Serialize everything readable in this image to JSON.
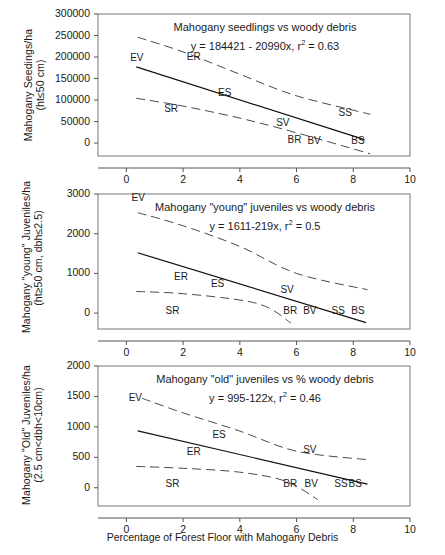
{
  "figure": {
    "xaxis_title": "Percentage of Forest Floor with Mahogany Debris",
    "x_ticks": [
      "0",
      "2",
      "4",
      "6",
      "8",
      "10"
    ]
  },
  "chart_data": [
    {
      "type": "scatter",
      "panel": 1,
      "title": "Mahogany seedlings vs woody debris",
      "equation": "y = 184421 - 20990x, r",
      "equation_sup": "2",
      "equation_tail": " = 0.63",
      "slope": -20990,
      "intercept": 184421,
      "r2": 0.63,
      "xlabel": "Percentage of Forest Floor with Mahogany Debris",
      "ylabel_line1": "Mahogany Seedings/ha",
      "ylabel_line2": "(ht≤50 cm)",
      "xlim": [
        -1,
        10
      ],
      "ylim": [
        -30000,
        300000
      ],
      "x_ticks": [
        0,
        2,
        4,
        6,
        8,
        10
      ],
      "y_ticks": [
        0,
        50000,
        100000,
        150000,
        200000,
        250000,
        300000
      ],
      "y_tick_labels": [
        "0",
        "50000",
        "100000",
        "150000",
        "200000",
        "250000",
        "300000"
      ],
      "grid": false,
      "legend": "none",
      "fit_line": {
        "x": [
          0.35,
          8.4
        ],
        "y": [
          177000,
          8000
        ]
      },
      "upper_band": {
        "x": [
          0.4,
          2.0,
          4.0,
          6.0,
          8.6
        ],
        "y": [
          246000,
          212000,
          160000,
          110000,
          67000
        ]
      },
      "lower_band": {
        "x": [
          0.35,
          2.0,
          4.0,
          6.0,
          8.6
        ],
        "y": [
          104000,
          86000,
          58000,
          24000,
          -25000
        ]
      },
      "point_labels": [
        {
          "label": "EV",
          "x": 0.45,
          "y": 196000
        },
        {
          "label": "ER",
          "x": 2.45,
          "y": 197000
        },
        {
          "label": "ES",
          "x": 3.55,
          "y": 115000
        },
        {
          "label": "SR",
          "x": 1.65,
          "y": 77000
        },
        {
          "label": "SV",
          "x": 5.6,
          "y": 45000
        },
        {
          "label": "SS",
          "x": 7.8,
          "y": 67000
        },
        {
          "label": "BR",
          "x": 6.0,
          "y": 6000
        },
        {
          "label": "BV",
          "x": 6.7,
          "y": 3000
        },
        {
          "label": "BS",
          "x": 8.25,
          "y": 3000
        }
      ]
    },
    {
      "type": "scatter",
      "panel": 2,
      "title": "Mahogany \"young\" juveniles vs woody debris",
      "equation": "y = 1611-219x, r",
      "equation_sup": "2",
      "equation_tail": " = 0.5",
      "slope": -219,
      "intercept": 1611,
      "r2": 0.5,
      "ylabel_line1": "Mahogany \"young\" Juveniles/ha",
      "ylabel_line2": "(ht≥50 cm, dbh≤2.5)",
      "xlim": [
        -1,
        10
      ],
      "ylim": [
        -400,
        3000
      ],
      "x_ticks": [
        0,
        2,
        4,
        6,
        8,
        10
      ],
      "y_ticks": [
        0,
        1000,
        2000,
        3000
      ],
      "y_tick_labels": [
        "0",
        "1000",
        "2000",
        "3000"
      ],
      "grid": false,
      "legend": "none",
      "fit_line": {
        "x": [
          0.4,
          8.45
        ],
        "y": [
          1520,
          -240
        ]
      },
      "upper_band": {
        "x": [
          0.4,
          2.0,
          4.0,
          6.0,
          8.5
        ],
        "y": [
          2530,
          2200,
          1680,
          1000,
          590
        ]
      },
      "lower_band": {
        "x": [
          0.35,
          2.0,
          4.0,
          5.0,
          5.8
        ],
        "y": [
          545,
          490,
          330,
          140,
          -250
        ]
      },
      "point_labels": [
        {
          "label": "EV",
          "x": 0.5,
          "y": 2870
        },
        {
          "label": "ER",
          "x": 2.0,
          "y": 880
        },
        {
          "label": "ES",
          "x": 3.3,
          "y": 720
        },
        {
          "label": "SR",
          "x": 1.7,
          "y": 30
        },
        {
          "label": "SV",
          "x": 5.75,
          "y": 560
        },
        {
          "label": "BR",
          "x": 5.85,
          "y": 30
        },
        {
          "label": "BV",
          "x": 6.55,
          "y": 30
        },
        {
          "label": "SS",
          "x": 7.55,
          "y": 30
        },
        {
          "label": "BS",
          "x": 8.25,
          "y": 30
        }
      ]
    },
    {
      "type": "scatter",
      "panel": 3,
      "title": "Mahogany \"old\" juveniles vs % woody debris",
      "equation": "y = 995-122x, r",
      "equation_sup": "2",
      "equation_tail": " = 0.46",
      "slope": -122,
      "intercept": 995,
      "r2": 0.46,
      "ylabel_line1": "Mahogany \"Old\" Juveniles/ha",
      "ylabel_line2": "(2.5 cm<dbh<10cm)",
      "xlim": [
        -1,
        10
      ],
      "ylim": [
        -300,
        2000
      ],
      "x_ticks": [
        0,
        2,
        4,
        6,
        8,
        10
      ],
      "y_ticks": [
        0,
        500,
        1000,
        1500,
        2000
      ],
      "y_tick_labels": [
        "0",
        "500",
        "1000",
        "1500",
        "2000"
      ],
      "grid": false,
      "legend": "none",
      "fit_line": {
        "x": [
          0.4,
          8.5
        ],
        "y": [
          935,
          60
        ]
      },
      "upper_band": {
        "x": [
          0.55,
          2.0,
          4.0,
          6.0,
          8.5
        ],
        "y": [
          1470,
          1230,
          930,
          600,
          460
        ]
      },
      "lower_band": {
        "x": [
          0.35,
          2.0,
          4.0,
          5.6,
          6.75
        ],
        "y": [
          350,
          320,
          255,
          110,
          -195
        ]
      },
      "point_labels": [
        {
          "label": "EV",
          "x": 0.4,
          "y": 1460
        },
        {
          "label": "ES",
          "x": 3.35,
          "y": 855
        },
        {
          "label": "ER",
          "x": 2.45,
          "y": 570
        },
        {
          "label": "SV",
          "x": 6.55,
          "y": 600
        },
        {
          "label": "SR",
          "x": 1.7,
          "y": 40
        },
        {
          "label": "BR",
          "x": 5.85,
          "y": 40
        },
        {
          "label": "BV",
          "x": 6.6,
          "y": 40
        },
        {
          "label": "SS",
          "x": 7.65,
          "y": 40
        },
        {
          "label": "BS",
          "x": 8.15,
          "y": 40
        }
      ]
    }
  ]
}
